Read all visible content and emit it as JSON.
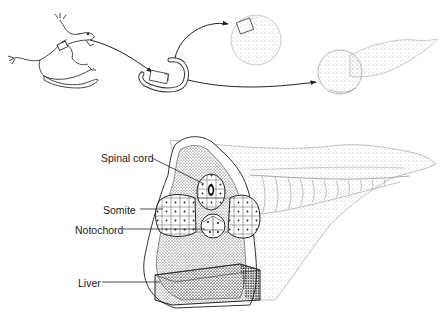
{
  "figure": {
    "top_panel": {
      "items": [
        {
          "id": "adult-salamander",
          "description": "salamander (source animal)"
        },
        {
          "id": "tissue-explant",
          "description": "curved tissue strip with small excised block"
        },
        {
          "id": "sphere-with-block",
          "description": "cell aggregate with implanted block"
        },
        {
          "id": "tailbud-embryo",
          "description": "tadpole-shaped embryo"
        }
      ]
    },
    "bottom_panel": {
      "labels": {
        "spinal_cord": "Spinal cord",
        "somite": "Somite",
        "notochord": "Notochord",
        "liver": "Liver"
      }
    }
  },
  "colors": {
    "ink": "#222222",
    "stipple": "#555555",
    "background": "#ffffff"
  }
}
